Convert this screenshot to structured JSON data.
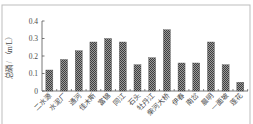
{
  "chart_data": {
    "type": "bar",
    "title": "",
    "xlabel": "",
    "ylabel": "总磷 / （m/L）",
    "ylim": [
      0,
      0.4
    ],
    "yticks": [
      "0",
      "0.1",
      "0.2",
      "0.3",
      "0.4"
    ],
    "ytick_values": [
      0,
      0.1,
      0.2,
      0.3,
      0.4
    ],
    "grid": false,
    "legend": null,
    "categories": [
      "二水源",
      "水泥厂",
      "通河",
      "佳木斯",
      "富锦",
      "同江",
      "石头",
      "牡丹江",
      "柴河大桥",
      "伊春",
      "南岔",
      "晨明",
      "一面坡",
      "莲花"
    ],
    "values": [
      0.12,
      0.18,
      0.23,
      0.28,
      0.3,
      0.28,
      0.15,
      0.19,
      0.35,
      0.16,
      0.16,
      0.28,
      0.15,
      0.05
    ],
    "colors": {
      "bar_dark": "#3e3e3e",
      "bar_light": "#9a9a9a",
      "axis": "#555555",
      "frame": "#bdbdbd"
    }
  }
}
